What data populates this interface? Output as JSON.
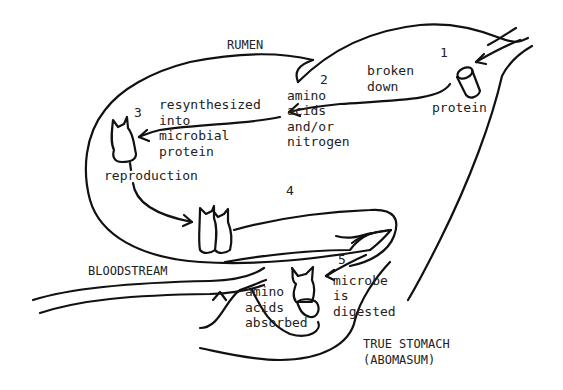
{
  "diagram": {
    "regions": {
      "rumen": "RUMEN",
      "bloodstream": "BLOODSTREAM",
      "true_stomach_line1": "TRUE STOMACH",
      "true_stomach_line2": "(ABOMASUM)"
    },
    "steps": [
      {
        "number": "1",
        "lines": [
          "protein"
        ]
      },
      {
        "number": "2",
        "lines": [
          "amino",
          "acids",
          "and/or",
          "nitrogen"
        ]
      },
      {
        "number": "3",
        "lines": [
          "resynthesized",
          "into",
          "microbial",
          "protein"
        ]
      },
      {
        "number": "4",
        "lines": [
          "reproduction"
        ]
      },
      {
        "number": "5",
        "lines": [
          "microbe",
          "is",
          "digested"
        ]
      }
    ],
    "arrow_labels": {
      "broken_down": [
        "broken",
        "down"
      ],
      "absorbed": [
        "amino",
        "acids",
        "absorbed"
      ]
    },
    "colors": {
      "ink": "#111111",
      "background": "#ffffff"
    }
  }
}
